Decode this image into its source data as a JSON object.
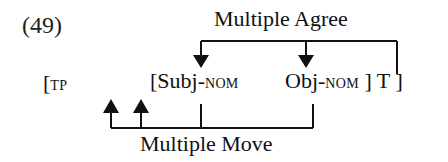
{
  "example": {
    "number": "(49)"
  },
  "labels": {
    "top_relation": "Multiple Agree",
    "bottom_relation": "Multiple Move"
  },
  "structure": {
    "tp_open": "[",
    "tp_label": "TP",
    "subj_open": "[Subj-",
    "subj_case": "NOM",
    "obj_word": "Obj-",
    "obj_case": "NOM",
    "obj_tail": " ] T ]"
  },
  "colors": {
    "ink": "#111111",
    "background": "#ffffff"
  }
}
